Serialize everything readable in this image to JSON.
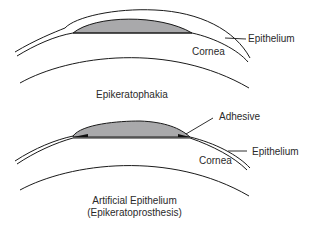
{
  "colors": {
    "line": "#1a1a1a",
    "lens_fill": "#a9a9ab",
    "adhesive": "#111111",
    "text": "#2a2a2a"
  },
  "panels": [
    {
      "id": "top",
      "title": "Epikeratophakia",
      "labels": {
        "epithelium": "Epithelium",
        "cornea": "Cornea"
      }
    },
    {
      "id": "bottom",
      "title_line1": "Artificial Epithelium",
      "title_line2": "(Epikeratoprosthesis)",
      "labels": {
        "adhesive": "Adhesive",
        "epithelium": "Epithelium",
        "cornea": "Cornea"
      }
    }
  ]
}
